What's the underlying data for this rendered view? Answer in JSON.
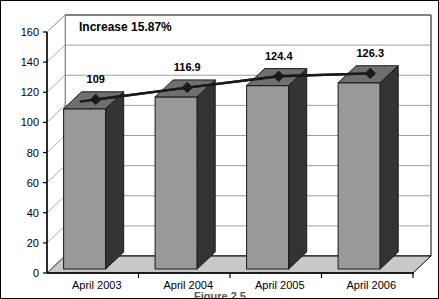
{
  "chart_data": {
    "type": "bar",
    "title": "",
    "subtitle": "",
    "xlabel": "",
    "ylabel": "",
    "categories": [
      "April 2003",
      "April 2004",
      "April 2005",
      "April 2006"
    ],
    "values": [
      109,
      116.9,
      124.4,
      126.3
    ],
    "value_labels": [
      "109",
      "116.9",
      "124.4",
      "126.3"
    ],
    "series": [
      {
        "name": "Columns",
        "type": "bar",
        "values": [
          109,
          116.9,
          124.4,
          126.3
        ]
      },
      {
        "name": "Trend line",
        "type": "line",
        "marker": "diamond",
        "values": [
          109,
          116.9,
          124.4,
          126.3
        ]
      }
    ],
    "ylim": [
      0,
      160
    ],
    "ytick_values": [
      0,
      20,
      40,
      60,
      80,
      100,
      120,
      140,
      160
    ],
    "ytick_labels": [
      "0",
      "20",
      "40",
      "60",
      "80",
      "100",
      "120",
      "140",
      "160"
    ],
    "grid": true,
    "grid_axis": "y",
    "legend": false,
    "legend_position": "none",
    "three_d": true,
    "annotations": [
      {
        "name": "increase-annotation",
        "text": "Increase 15.87%",
        "x": 0.05,
        "y": 158
      }
    ],
    "colors": {
      "bar_front": "#999999",
      "bar_top": "#6f6f6f",
      "bar_side": "#333333",
      "floor": "#c8c8c8",
      "wall": "#ffffff",
      "grid": "#888888",
      "axis": "#000000",
      "line": "#1a1a1a",
      "marker": "#1a1a1a",
      "text": "#000000"
    }
  },
  "caption": {
    "text": "Figure 2.5"
  }
}
